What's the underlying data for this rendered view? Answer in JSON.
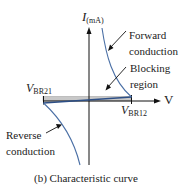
{
  "figure": {
    "caption": "(b) Characteristic curve",
    "y_axis": {
      "symbol": "I",
      "unit": "(mA)"
    },
    "x_axis": {
      "symbol": "V"
    },
    "labels": {
      "vbr21": {
        "main": "V",
        "sub": "BR21"
      },
      "vbr12": {
        "main": "V",
        "sub": "BR12"
      },
      "forward_line1": "Forward",
      "forward_line2": "conduction",
      "blocking_line1": "Blocking",
      "blocking_line2": "region",
      "reverse_line1": "Reverse",
      "reverse_line2": "conduction"
    },
    "colors": {
      "curve": "#4a6fa5",
      "axis": "#111111",
      "blocking_band": "#c8c8c8",
      "text": "#222222"
    }
  }
}
